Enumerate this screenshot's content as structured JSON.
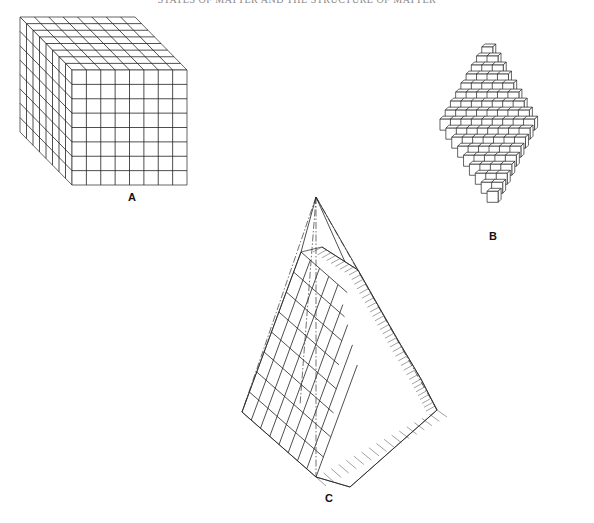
{
  "page": {
    "running_head": "STATES OF MATTER AND THE STRUCTURE OF MATTER"
  },
  "figures": [
    {
      "id": "A",
      "label": "A",
      "description": "Cubic crystal built from 8 x 8 x 8 unit cubes",
      "grid": {
        "width": 8,
        "height": 8,
        "depth": 8
      }
    },
    {
      "id": "B",
      "label": "B",
      "description": "Octahedral crystal formed by stacked unit cubes",
      "layers": 9
    },
    {
      "id": "C",
      "label": "C",
      "description": "Stepped octahedral face built from cubes with dash-dot construction lines to apex",
      "steps": 5
    }
  ]
}
